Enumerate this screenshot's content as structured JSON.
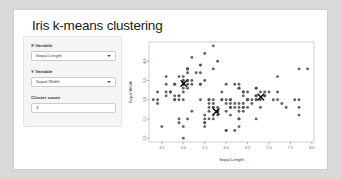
{
  "app": {
    "title": "Iris k-means clustering"
  },
  "controls": {
    "x_variable": {
      "label": "X Variable",
      "value": "Sepal.Length",
      "options": [
        "Sepal.Length",
        "Sepal.Width",
        "Petal.Length",
        "Petal.Width"
      ],
      "icon": "chevron-down-icon"
    },
    "y_variable": {
      "label": "Y Variable",
      "value": "Sepal.Width",
      "options": [
        "Sepal.Length",
        "Sepal.Width",
        "Petal.Length",
        "Petal.Width"
      ],
      "icon": "chevron-down-icon"
    },
    "cluster_count": {
      "label": "Cluster count",
      "value": "3",
      "placeholder": "3"
    }
  },
  "colors": {
    "panel_bg": "#f5f5f5",
    "panel_border": "#e3e3e3",
    "input_bg": "#ffffff",
    "input_border": "#cccccc",
    "window_bg": "#ffffff",
    "point": "#4d4d4d",
    "centroid": "#000000",
    "axis": "#666666",
    "page_bg": "#d9d9d9"
  },
  "chart_data": {
    "type": "scatter",
    "title": "",
    "xlabel": "Sepal.Length",
    "ylabel": "Sepal.Width",
    "xlim": [
      4.2,
      8.05
    ],
    "ylim": [
      1.9,
      4.5
    ],
    "xticks": [
      4.5,
      5.0,
      5.5,
      6.0,
      6.5,
      7.0,
      7.5,
      8.0
    ],
    "yticks": [
      2.0,
      2.5,
      3.0,
      3.5,
      4.0
    ],
    "grid": false,
    "legend": "none",
    "marker": "filled-circle",
    "centroid_marker": "x-cross",
    "series": [
      {
        "name": "iris observations",
        "x": [
          5.1,
          4.9,
          4.7,
          4.6,
          5.0,
          5.4,
          4.6,
          5.0,
          4.4,
          4.9,
          5.4,
          4.8,
          4.8,
          4.3,
          5.8,
          5.7,
          5.4,
          5.1,
          5.7,
          5.1,
          5.4,
          5.1,
          4.6,
          5.1,
          4.8,
          5.0,
          5.0,
          5.2,
          5.2,
          4.7,
          4.8,
          5.4,
          5.2,
          5.5,
          4.9,
          5.0,
          5.5,
          4.9,
          4.4,
          5.1,
          5.0,
          4.5,
          4.4,
          5.0,
          5.1,
          4.8,
          5.1,
          4.6,
          5.3,
          5.0,
          7.0,
          6.4,
          6.9,
          5.5,
          6.5,
          5.7,
          6.3,
          4.9,
          6.6,
          5.2,
          5.0,
          5.9,
          6.0,
          6.1,
          5.6,
          6.7,
          5.6,
          5.8,
          6.2,
          5.6,
          5.9,
          6.1,
          6.3,
          6.1,
          6.4,
          6.6,
          6.8,
          6.7,
          6.0,
          5.7,
          5.5,
          5.5,
          5.8,
          6.0,
          5.4,
          6.0,
          6.7,
          6.3,
          5.6,
          5.5,
          5.5,
          6.1,
          5.8,
          5.0,
          5.6,
          5.7,
          5.7,
          6.2,
          5.1,
          5.7,
          6.3,
          5.8,
          7.1,
          6.3,
          6.5,
          7.6,
          4.9,
          7.3,
          6.7,
          7.2,
          6.5,
          6.4,
          6.8,
          5.7,
          5.8,
          6.4,
          6.5,
          7.7,
          7.7,
          6.0,
          6.9,
          5.6,
          7.7,
          6.3,
          6.7,
          7.2,
          6.2,
          6.1,
          6.4,
          7.2,
          7.4,
          7.9,
          6.4,
          6.3,
          6.1,
          7.7,
          6.3,
          6.4,
          6.0,
          6.9,
          6.7,
          6.9,
          5.8,
          6.8,
          6.7,
          6.7,
          6.3,
          6.5,
          6.2,
          5.9
        ],
        "y": [
          3.5,
          3.0,
          3.2,
          3.1,
          3.6,
          3.9,
          3.4,
          3.4,
          2.9,
          3.1,
          3.7,
          3.4,
          3.0,
          3.0,
          4.0,
          4.4,
          3.9,
          3.5,
          3.8,
          3.8,
          3.4,
          3.7,
          3.6,
          3.3,
          3.4,
          3.0,
          3.4,
          3.5,
          3.4,
          3.2,
          3.1,
          3.4,
          4.1,
          4.2,
          3.1,
          3.2,
          3.5,
          3.6,
          3.0,
          3.4,
          3.5,
          2.3,
          3.2,
          3.5,
          3.8,
          3.0,
          3.8,
          3.2,
          3.7,
          3.3,
          3.2,
          3.2,
          3.1,
          2.3,
          2.8,
          2.8,
          3.3,
          2.4,
          2.9,
          2.7,
          2.0,
          3.0,
          2.2,
          2.9,
          2.9,
          3.1,
          3.0,
          2.7,
          2.2,
          2.5,
          3.2,
          2.8,
          2.5,
          2.8,
          2.9,
          3.0,
          2.8,
          3.0,
          2.9,
          2.6,
          2.4,
          2.4,
          2.7,
          2.7,
          3.0,
          3.4,
          3.1,
          2.3,
          3.0,
          2.5,
          2.6,
          3.0,
          2.6,
          2.3,
          2.7,
          3.0,
          2.9,
          2.9,
          2.5,
          2.8,
          3.3,
          2.7,
          3.0,
          2.9,
          3.0,
          3.0,
          2.5,
          2.9,
          2.5,
          3.6,
          3.2,
          2.7,
          3.0,
          2.5,
          2.8,
          3.2,
          3.0,
          3.8,
          2.6,
          2.2,
          3.2,
          2.8,
          2.8,
          2.7,
          3.3,
          3.2,
          2.8,
          3.0,
          2.8,
          3.0,
          2.8,
          3.8,
          2.8,
          2.8,
          2.6,
          3.0,
          3.4,
          3.1,
          3.0,
          3.1,
          3.1,
          3.1,
          2.7,
          3.2,
          3.3,
          3.0,
          2.5,
          3.0,
          3.4,
          3.0
        ]
      }
    ],
    "centroids": {
      "name": "cluster centers",
      "x": [
        5.01,
        6.81,
        5.77
      ],
      "y": [
        3.42,
        3.07,
        2.69
      ]
    }
  }
}
